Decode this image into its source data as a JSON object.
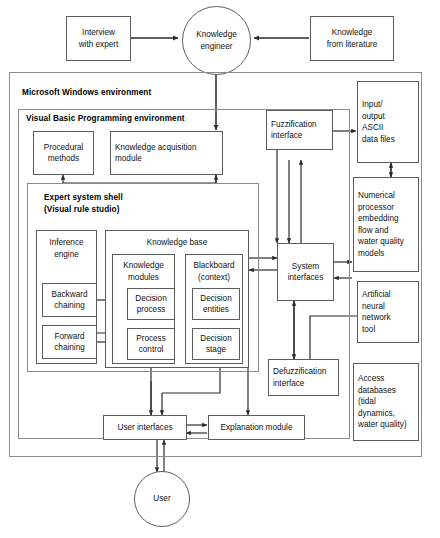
{
  "diagram": {
    "title_caption": "",
    "external": {
      "interview": "Interview\nwith expert",
      "knowledge_engineer": "Knowledge\nengineer",
      "literature": "Knowledge\nfrom literature",
      "user": "User"
    },
    "panels": {
      "windows": "Microsoft Windows environment",
      "vb": "Visual Basic Programming environment",
      "shell": "Expert system shell\n(Visual rule studio)"
    },
    "vb_boxes": {
      "procedural": "Procedural\nmethods",
      "acquisition": "Knowledge acquisition\nmodule"
    },
    "shell_boxes": {
      "inference_engine": "Inference\nengine",
      "backward": "Backward\nchaining",
      "forward": "Forward\nchaining",
      "knowledge_base": "Knowledge base",
      "knowledge_modules": "Knowledge\nmodules",
      "decision_process": "Decision\nprocess",
      "process_control": "Process\ncontrol",
      "blackboard": "Blackboard\n(context)",
      "decision_entities": "Decision\nentities",
      "decision_stage": "Decision\nstage"
    },
    "interfaces": {
      "fuzzification": "Fuzzification\ninterface",
      "system": "System\ninterfaces",
      "defuzzification": "Defuzzification\ninterface",
      "user_interfaces": "User interfaces",
      "explanation": "Explanation module"
    },
    "right_column": {
      "io_files": "Input/\noutput\nASCII\ndata files",
      "numerical": "Numerical\nprocessor\nembedding\nflow and\nwater quality\nmodels",
      "ann": "Artificial\nneural\nnetwork\ntool",
      "access_db": "Access\ndatabases\n(tidal\ndynamics,\nwater quality)"
    },
    "colors": {
      "box_border": "#5c5c5c",
      "panel_border": "#8a8a8a",
      "line": "#3a3a3a",
      "background": "#ffffff"
    }
  }
}
